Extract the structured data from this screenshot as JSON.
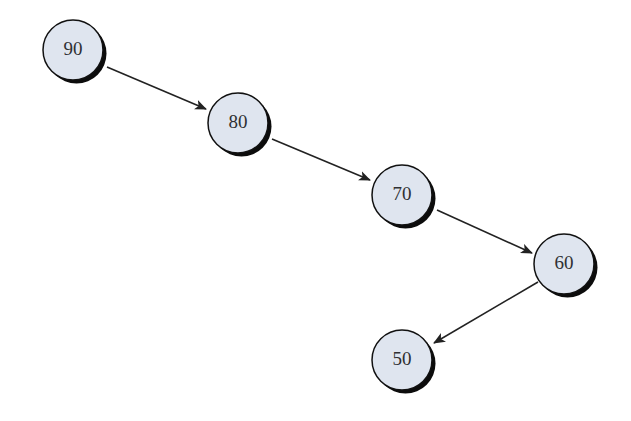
{
  "diagram": {
    "type": "binary-tree",
    "colors": {
      "node_fill": "#dfe5ef",
      "node_stroke": "#111111",
      "shadow": "#0c0c0c",
      "edge": "#222222",
      "text": "#2f3033"
    },
    "nodes": [
      {
        "id": "n90",
        "label": "90",
        "x": 73,
        "y": 50
      },
      {
        "id": "n80",
        "label": "80",
        "x": 238,
        "y": 123
      },
      {
        "id": "n70",
        "label": "70",
        "x": 402,
        "y": 195
      },
      {
        "id": "n60",
        "label": "60",
        "x": 564,
        "y": 264
      },
      {
        "id": "n50",
        "label": "50",
        "x": 402,
        "y": 360
      }
    ],
    "edges": [
      {
        "from": "90",
        "to": "80",
        "x1": 107,
        "y1": 67,
        "x2": 206,
        "y2": 109
      },
      {
        "from": "80",
        "to": "70",
        "x1": 272,
        "y1": 139,
        "x2": 370,
        "y2": 180
      },
      {
        "from": "70",
        "to": "60",
        "x1": 437,
        "y1": 210,
        "x2": 532,
        "y2": 253
      },
      {
        "from": "60",
        "to": "50",
        "x1": 538,
        "y1": 282,
        "x2": 434,
        "y2": 343
      }
    ],
    "node_radius": 30
  }
}
